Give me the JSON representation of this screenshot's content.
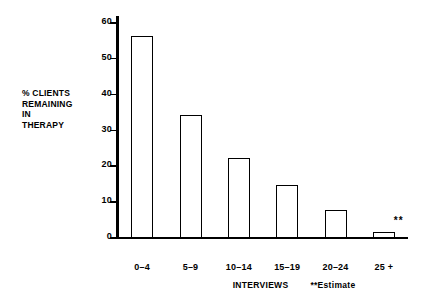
{
  "chart_data": {
    "type": "bar",
    "title": "",
    "subtitle": "",
    "categories": [
      "0–4",
      "5–9",
      "10–14",
      "15–19",
      "20–24",
      "25 +"
    ],
    "values": [
      56,
      34,
      22,
      14.5,
      7.5,
      1.5
    ],
    "series": [
      {
        "name": "% Clients Remaining in Therapy",
        "values": [
          56,
          34,
          22,
          14.5,
          7.5,
          1.5
        ]
      }
    ],
    "xlabel": "INTERVIEWS",
    "ylabel": "% CLIENTS REMAINING IN THERAPY",
    "ylim": [
      0,
      60
    ],
    "yticks": [
      0,
      10,
      20,
      30,
      40,
      50,
      60
    ],
    "ytick_labels": [
      "0",
      "10",
      "20",
      "30",
      "40",
      "50",
      "60"
    ],
    "grid": false,
    "legend": "none",
    "bar_style": "outlined",
    "bar_fill_color": "#ffffff",
    "bar_edge_color": "#000000",
    "axis_color": "#000000",
    "background_color": "#ffffff",
    "annotations": [
      {
        "text": "**",
        "category": "25 +",
        "position": "above-right-of-bar",
        "meaning": "Estimate"
      }
    ]
  },
  "axis": {
    "y_caption_lines": [
      "% CLIENTS",
      "REMAINING",
      "IN",
      "THERAPY"
    ],
    "y_caption_text": "% CLIENTS\nREMAINING\nIN\nTHERAPY"
  },
  "footer": {
    "x_axis_title": "INTERVIEWS",
    "estimate_note": "**Estimate"
  }
}
